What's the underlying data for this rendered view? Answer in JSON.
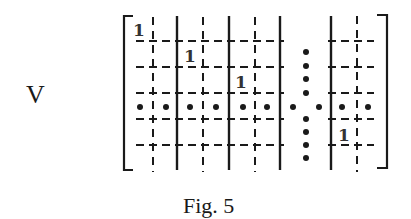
{
  "figure": {
    "label": "V",
    "caption": "Fig. 5",
    "entries": [
      "1",
      "1",
      "1",
      "1"
    ]
  },
  "matrix": {
    "description": "Block matrix V with dashed cell grid, solid block separators, unit entries along block diagonal, and ellipsis dots",
    "solid_lines_x": [
      177,
      229,
      280,
      331
    ],
    "dashed_lines_x": [
      153,
      203,
      255,
      357
    ],
    "dashed_lines_y": [
      41,
      67,
      93,
      119,
      145
    ],
    "dot_row_y": 107,
    "dot_column_x": 306,
    "unit_entries": [
      {
        "x": 139,
        "y": 30,
        "text": "1"
      },
      {
        "x": 190,
        "y": 57,
        "text": "1"
      },
      {
        "x": 241,
        "y": 83,
        "text": "1"
      },
      {
        "x": 344,
        "y": 136,
        "text": "1"
      }
    ]
  },
  "colors": {
    "ink": "#1a1a1a",
    "background": "#ffffff"
  }
}
